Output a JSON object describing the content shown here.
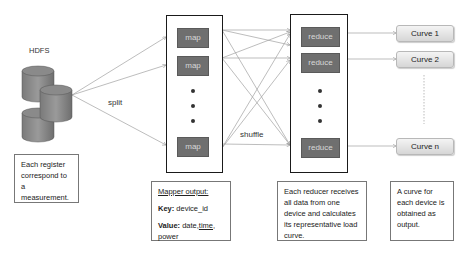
{
  "storage": {
    "label": "HDFS"
  },
  "edges": {
    "split_label": "split",
    "shuffle_label": "shuffle"
  },
  "mappers": {
    "items": [
      "map",
      "map",
      "map"
    ]
  },
  "reducers": {
    "items": [
      "reduce",
      "reduce",
      "reduce"
    ]
  },
  "outputs": {
    "items": [
      "Curve 1",
      "Curve 2",
      "Curve n"
    ]
  },
  "notes": {
    "hdfs": "Each register correspond to a measurement.",
    "mapper": {
      "title": "Mapper output:",
      "key_label": "Key:",
      "key_value": " device_id",
      "value_label": "Value:",
      "value_part1": " date,",
      "value_part2": "time",
      "value_part3": ", power"
    },
    "reducer": "Each reducer receives all data from one device and calculates its representative load curve.",
    "output": "A curve for each device is obtained as output."
  },
  "colors": {
    "process_box": "#6f6f6f",
    "curve_box": "#e4e4e4",
    "lines": "#9a9a9a"
  }
}
